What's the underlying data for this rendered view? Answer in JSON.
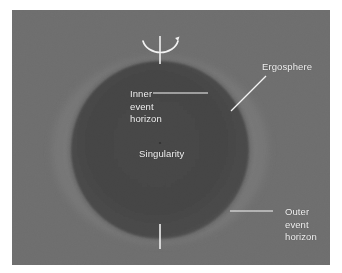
{
  "figure": {
    "canvas": {
      "width": 342,
      "height": 273
    },
    "panel": {
      "background_color": "#6e6e6e",
      "border_color": "#ffffff",
      "left": 12,
      "top": 10,
      "width": 318,
      "height": 255
    }
  },
  "colors": {
    "page_background": "#ffffff",
    "panel_background": "#6e6e6e",
    "ergosphere_fill": "#7a7a7a",
    "ergosphere_edge": "#8a8a8a",
    "outer_event_horizon_fill": "#646464",
    "inner_event_horizon_fill": "#4a4a4a",
    "singularity_region_fill": "#434343",
    "label_text": "#f2f2f2",
    "leader_line": "#f5f5f5",
    "rotation_axis": "#f5f5f5"
  },
  "labels": {
    "inner_event_horizon": {
      "lines": [
        "Inner",
        "event",
        "horizon"
      ],
      "line1": "Inner",
      "line2": "event",
      "line3": "horizon"
    },
    "singularity": {
      "text": "Singularity"
    },
    "ergosphere": {
      "text": "Ergosphere"
    },
    "outer_event_horizon": {
      "lines": [
        "Outer",
        "event",
        "horizon"
      ],
      "line1": "Outer",
      "line2": "event",
      "line3": "horizon"
    }
  },
  "icons": {
    "rotation_axis": "rotation-axis-line",
    "rotation_arrow": "rotation-arrow-arc"
  },
  "geometry": {
    "center_x": 148,
    "center_y": 140,
    "ergosphere_rx": 110,
    "ergosphere_ry": 96,
    "outer_horizon_r": 92,
    "inner_horizon_r": 88,
    "rotation_axis_top_y": 26,
    "rotation_axis_bottom_y": 238
  }
}
